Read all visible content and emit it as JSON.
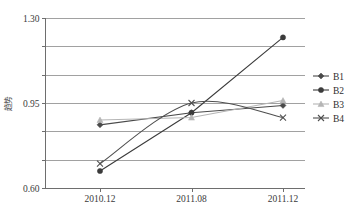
{
  "chart_data": {
    "type": "line",
    "title": "",
    "xlabel": "",
    "ylabel": "趋势",
    "categories": [
      "2010.12",
      "2011.08",
      "2011.12"
    ],
    "ylim": [
      0.6,
      1.3
    ],
    "yticks": [
      0.6,
      0.95,
      1.3
    ],
    "ytick_labels": [
      "0.60",
      "0.95",
      "1.30"
    ],
    "gridlines": [
      0.6,
      0.716667,
      0.833333,
      0.95,
      1.066667,
      1.183333,
      1.3
    ],
    "grid": true,
    "legend_position": "right",
    "series": [
      {
        "name": "B1",
        "marker": "diamond",
        "color": "#4a4a4a",
        "smooth": false,
        "values": [
          0.86,
          0.91,
          0.94
        ]
      },
      {
        "name": "B2",
        "marker": "circle",
        "color": "#3b3b3b",
        "smooth": false,
        "values": [
          0.67,
          0.91,
          1.22
        ]
      },
      {
        "name": "B3",
        "marker": "triangle",
        "color": "#b5b5b5",
        "smooth": false,
        "values": [
          0.88,
          0.89,
          0.96
        ]
      },
      {
        "name": "B4",
        "marker": "cross",
        "color": "#4f4f4f",
        "smooth": true,
        "values": [
          0.7,
          0.95,
          0.89
        ]
      }
    ]
  },
  "axes": {
    "y_title": "趋势",
    "y_labels": [
      "1.30",
      "0.95",
      "0.60"
    ],
    "x_labels": [
      "2010.12",
      "2011.08",
      "2011.12"
    ]
  },
  "legend": {
    "items": [
      {
        "label": "B1"
      },
      {
        "label": "B2"
      },
      {
        "label": "B3"
      },
      {
        "label": "B4"
      }
    ]
  }
}
